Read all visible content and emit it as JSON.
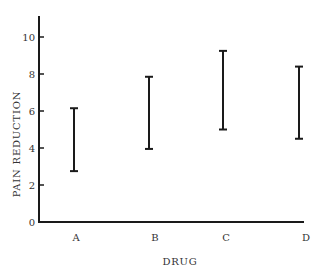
{
  "chart_data": {
    "type": "errorbar",
    "title": "",
    "xlabel": "DRUG",
    "ylabel": "PAIN REDUCTION",
    "categories": [
      "A",
      "B",
      "C",
      "D"
    ],
    "series": [
      {
        "name": "Pain reduction range",
        "low": [
          2.75,
          3.95,
          5.0,
          4.5
        ],
        "high": [
          6.15,
          7.85,
          9.25,
          8.4
        ]
      }
    ],
    "yticks": [
      0,
      2,
      4,
      6,
      8,
      10
    ],
    "ylim": [
      0,
      11
    ],
    "grid": false,
    "legend": "none",
    "colors": {
      "axis": "#1a1a1a",
      "bar": "#1a1a1a",
      "text": "#333333"
    }
  }
}
